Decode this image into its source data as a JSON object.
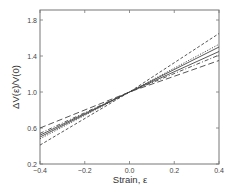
{
  "chart_data": {
    "type": "line",
    "title": "",
    "xlabel": "Strain, ε",
    "ylabel": "ΔV(ε)/V(0)",
    "xlim": [
      -0.4,
      0.4
    ],
    "ylim": [
      0.2,
      1.9
    ],
    "xticks": [
      -0.4,
      -0.2,
      0.0,
      0.2,
      0.4
    ],
    "xtick_labels": [
      "−0.4",
      "−0.2",
      "0.0",
      "0.2",
      "0.4"
    ],
    "yticks": [
      0.2,
      0.6,
      1.0,
      1.4,
      1.8
    ],
    "ytick_labels": [
      "0.2",
      "0.6",
      "1.0",
      "1.4",
      "1.8"
    ],
    "grid": false,
    "legend": null,
    "x": [
      -0.4,
      0.0,
      0.4
    ],
    "series": [
      {
        "name": "short-dashed upper",
        "style": "short-dash",
        "values": [
          0.41,
          1.0,
          1.65
        ]
      },
      {
        "name": "dotted",
        "style": "dotted",
        "values": [
          0.48,
          1.0,
          1.53
        ]
      },
      {
        "name": "solid 1",
        "style": "solid",
        "values": [
          0.5,
          1.0,
          1.5
        ]
      },
      {
        "name": "solid 2",
        "style": "solid",
        "values": [
          0.52,
          1.0,
          1.45
        ]
      },
      {
        "name": "dash-dot",
        "style": "dash-dot",
        "values": [
          0.54,
          1.0,
          1.41
        ]
      },
      {
        "name": "long-dashed lower",
        "style": "long-dash",
        "values": [
          0.6,
          1.0,
          1.35
        ]
      }
    ]
  },
  "colors": {
    "line": "#444444",
    "frame": "#666666",
    "background": "#ffffff"
  }
}
